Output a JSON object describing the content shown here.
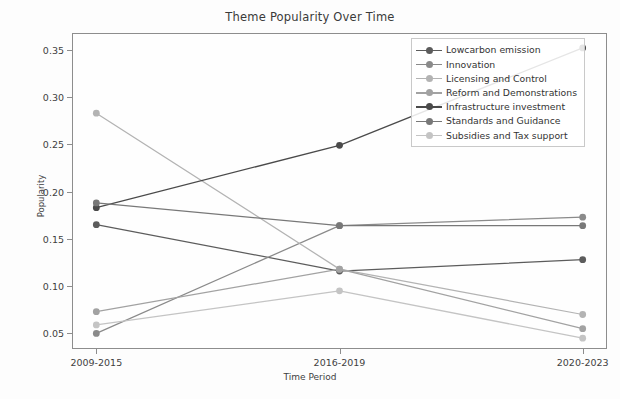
{
  "chart_data": {
    "type": "line",
    "title": "Theme Popularity Over Time",
    "xlabel": "Time Period",
    "ylabel": "Popularity",
    "categories": [
      "2009-2015",
      "2016-2019",
      "2020-2023"
    ],
    "yticks": [
      "0.05",
      "0.10",
      "0.15",
      "0.20",
      "0.25",
      "0.30",
      "0.35"
    ],
    "ytick_values": [
      0.05,
      0.1,
      0.15,
      0.2,
      0.25,
      0.3,
      0.35
    ],
    "ylim": [
      0.0335,
      0.3678
    ],
    "xlim": [
      -0.1,
      2.1
    ],
    "grid": false,
    "legend_position": "upper right",
    "marker": "circle",
    "series": [
      {
        "name": "Lowcarbon emission",
        "values": [
          0.165,
          0.116,
          0.128
        ],
        "color": "#5c5c5c"
      },
      {
        "name": "Innovation",
        "values": [
          0.05,
          0.164,
          0.173
        ],
        "color": "#8a8a8a"
      },
      {
        "name": "Licensing and Control",
        "values": [
          0.283,
          0.118,
          0.07
        ],
        "color": "#b3b3b3"
      },
      {
        "name": "Reform and Demonstrations",
        "values": [
          0.073,
          0.118,
          0.055
        ],
        "color": "#a2a2a2"
      },
      {
        "name": "Infrastructure investment",
        "values": [
          0.183,
          0.249,
          0.352
        ],
        "color": "#4a4a4a"
      },
      {
        "name": "Standards and Guidance",
        "values": [
          0.188,
          0.164,
          0.164
        ],
        "color": "#787878"
      },
      {
        "name": "Subsidies and Tax support",
        "values": [
          0.059,
          0.095,
          0.045
        ],
        "color": "#c4c4c4"
      }
    ]
  },
  "axes": {
    "frame_color": "#8d8d8d",
    "background": "#fefefe"
  }
}
